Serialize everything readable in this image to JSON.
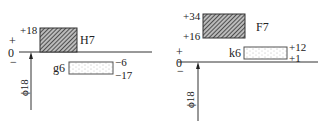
{
  "diagrams": [
    {
      "name": "H7/g6",
      "nominal_label": "ϕ18",
      "zero_label": "0",
      "plus_label": "+",
      "minus_label": "−",
      "hole": {
        "label": "H7",
        "upper": "+18",
        "lower": "0"
      },
      "shaft": {
        "label": "g6",
        "upper": "−6",
        "lower": "−17"
      }
    },
    {
      "name": "F7/k6",
      "nominal_label": "ϕ18",
      "zero_label": "0",
      "plus_label": "+",
      "minus_label": "−",
      "hole": {
        "label": "F7",
        "upper": "+34",
        "lower": "+16"
      },
      "shaft": {
        "label": "k6",
        "upper": "+12",
        "lower": "+1"
      }
    }
  ],
  "colors": {
    "line": "#333333",
    "hatch": "#444444",
    "dots": "#999999"
  }
}
